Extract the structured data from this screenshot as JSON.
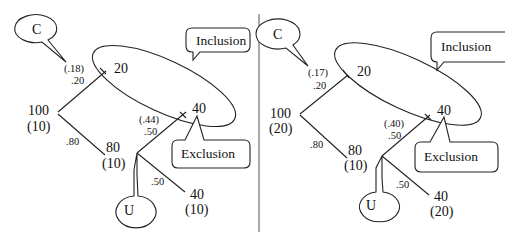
{
  "diagram": {
    "panels": [
      {
        "id": "left",
        "root": {
          "value": "100",
          "count": "(10)"
        },
        "upper_branch": {
          "prob_observed": "(.18)",
          "prob": ".20",
          "node_value": "20"
        },
        "lower_branch": {
          "prob": ".80",
          "node_value": "80",
          "node_count": "(10)"
        },
        "chance_node": {
          "upper": {
            "prob_observed": "(.44)",
            "prob": ".50",
            "node_value": "40"
          },
          "lower": {
            "prob": ".50",
            "node_value": "40",
            "node_count": "(10)"
          }
        },
        "callouts": {
          "c": "C",
          "u": "U",
          "inclusion": "Inclusion",
          "exclusion": "Exclusion"
        }
      },
      {
        "id": "right",
        "root": {
          "value": "100",
          "count": "(20)"
        },
        "upper_branch": {
          "prob_observed": "(.17)",
          "prob": ".20",
          "node_value": "20"
        },
        "lower_branch": {
          "prob": ".80",
          "node_value": "80",
          "node_count": "(10)"
        },
        "chance_node": {
          "upper": {
            "prob_observed": "(.40)",
            "prob": ".50",
            "node_value": "40"
          },
          "lower": {
            "prob": ".50",
            "node_value": "40",
            "node_count": "(20)"
          }
        },
        "callouts": {
          "c": "C",
          "u": "U",
          "inclusion": "Inclusion",
          "exclusion": "Exclusion"
        }
      }
    ]
  }
}
